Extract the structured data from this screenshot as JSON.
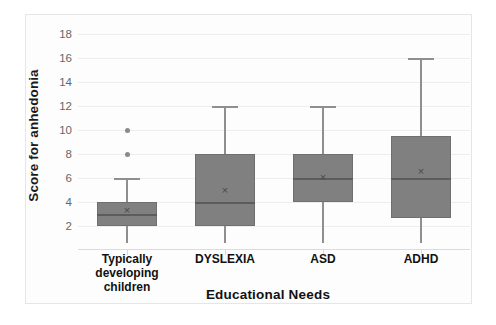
{
  "chart_data": {
    "type": "box",
    "title": "",
    "xlabel": "Educational Needs",
    "ylabel": "Score for anhedonia",
    "ylim": [
      0,
      19
    ],
    "yticks": [
      2,
      4,
      6,
      8,
      10,
      12,
      14,
      16,
      18
    ],
    "grid": true,
    "legend": "none",
    "categories": [
      "Typically developing children",
      "DYSLEXIA",
      "ASD",
      "ADHD"
    ],
    "boxes": [
      {
        "category": "Typically developing children",
        "label_line1": "Typically developing",
        "label_line2": "children",
        "whisker_low": 0.6,
        "q1": 2.0,
        "median": 3.0,
        "q3": 4.0,
        "whisker_high": 6.0,
        "mean": 3.3,
        "outliers": [
          8,
          10
        ]
      },
      {
        "category": "DYSLEXIA",
        "label_line1": "DYSLEXIA",
        "label_line2": "",
        "whisker_low": 0.6,
        "q1": 2.0,
        "median": 4.0,
        "q3": 8.0,
        "whisker_high": 12.0,
        "mean": 5.0,
        "outliers": []
      },
      {
        "category": "ASD",
        "label_line1": "ASD",
        "label_line2": "",
        "whisker_low": 0.6,
        "q1": 4.0,
        "median": 6.0,
        "q3": 8.0,
        "whisker_high": 12.0,
        "mean": 6.1,
        "outliers": []
      },
      {
        "category": "ADHD",
        "label_line1": "ADHD",
        "label_line2": "",
        "whisker_low": 0.6,
        "q1": 2.7,
        "median": 6.0,
        "q3": 9.5,
        "whisker_high": 16.0,
        "mean": 6.6,
        "outliers": []
      }
    ],
    "mean_marker": "×",
    "colors": {
      "box_fill": "#808080",
      "box_border": "#6f6f6f",
      "median_line": "#5c5c5c",
      "whisker": "#8f8f8f",
      "outlier": "#8a8a8a",
      "gridline": "#ededed",
      "tick_text": "#666666",
      "axis_title": "#111111",
      "background": "#ffffff"
    }
  }
}
